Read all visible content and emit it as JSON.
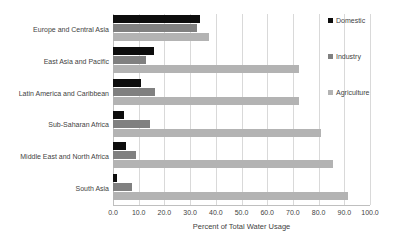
{
  "chart_data": {
    "type": "bar",
    "orientation": "horizontal",
    "title": "",
    "xlabel": "Percent of Total Water Usage",
    "ylabel": "",
    "xlim": [
      0.0,
      100.0
    ],
    "xticks": [
      "0.0",
      "10.0",
      "20.0",
      "30.0",
      "40.0",
      "50.0",
      "60.0",
      "70.0",
      "80.0",
      "90.0",
      "100.0"
    ],
    "xtick_values": [
      0,
      10,
      20,
      30,
      40,
      50,
      60,
      70,
      80,
      90,
      100
    ],
    "grid": "vertical",
    "legend_position": "right",
    "categories": [
      "Europe and Central Asia",
      "East Asia and Pacific",
      "Latin America and Caribbean",
      "Sub-Saharan Africa",
      "Middle East and North Africa",
      "South Asia"
    ],
    "series": [
      {
        "name": "Domestic",
        "color": "#0d0d0d",
        "values": [
          34.0,
          16.0,
          10.8,
          4.3,
          5.1,
          1.7
        ]
      },
      {
        "name": "Industry",
        "color": "#808080",
        "values": [
          32.5,
          13.0,
          16.3,
          14.4,
          8.9,
          7.3
        ]
      },
      {
        "name": "Agriculture",
        "color": "#b3b3b3",
        "values": [
          37.4,
          72.5,
          72.5,
          80.8,
          85.5,
          91.3
        ]
      }
    ]
  }
}
